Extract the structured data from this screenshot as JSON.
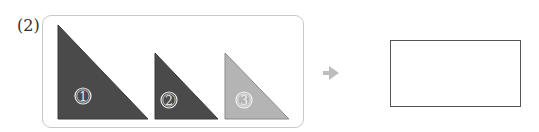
{
  "problem": {
    "number_label": "(2)"
  },
  "pieces": [
    {
      "id": "1",
      "marker": "①",
      "color": "#4a4a4a",
      "size": "large"
    },
    {
      "id": "2",
      "marker": "②",
      "color": "#4a4a4a",
      "size": "small"
    },
    {
      "id": "3",
      "marker": "③",
      "color": "#b4b4b4",
      "size": "small"
    }
  ],
  "arrow": {
    "glyph": "➜",
    "color": "#bdbdbd"
  },
  "answer_box": {
    "content": ""
  },
  "colors": {
    "dark_piece": "#4a4a4a",
    "light_piece": "#b4b4b4",
    "frame_border": "#c8c8c8",
    "answer_border": "#555555"
  }
}
